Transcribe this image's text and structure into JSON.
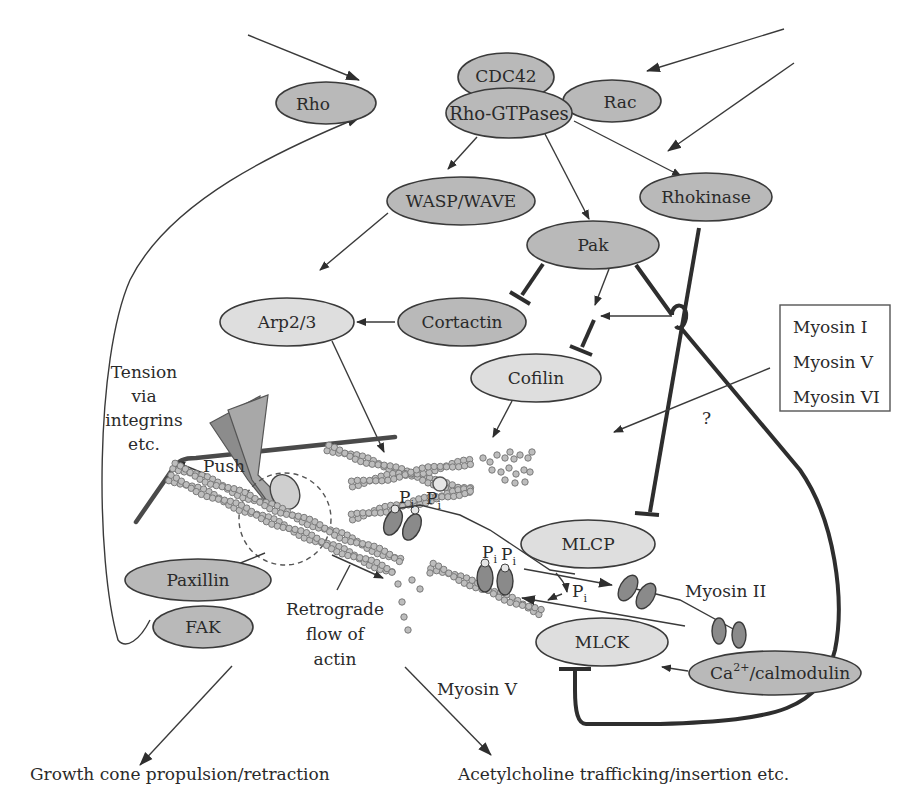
{
  "diagram": {
    "colors": {
      "background": "#ffffff",
      "node_dark_fill": "#b9b9b9",
      "node_light_fill": "#dedede",
      "stroke": "#3a3a3a",
      "actin_bead": "#bdbdbd"
    },
    "nodes": {
      "cdc42": "CDC42",
      "rho": "Rho",
      "rho_gtpases": "Rho-GTPases",
      "rac": "Rac",
      "wasp_wave": "WASP/WAVE",
      "pak": "Pak",
      "rhokinase": "Rhokinase",
      "arp23": "Arp2/3",
      "cortactin": "Cortactin",
      "cofilin": "Cofilin",
      "mlcp": "MLCP",
      "mlck": "MLCK",
      "calmodulin_base": "Ca",
      "calmodulin_sup": "2+",
      "calmodulin_rest": "/calmodulin",
      "paxillin": "Paxillin",
      "fak": "FAK"
    },
    "myosin_box": {
      "items": [
        "Myosin I",
        "Myosin V",
        "Myosin VI"
      ]
    },
    "labels": {
      "tension": [
        "Tension",
        "via",
        "integrins",
        "etc."
      ],
      "push": "Push",
      "retrograde": [
        "Retrograde",
        "flow of",
        "actin"
      ],
      "question": "?",
      "myosin_ii": "Myosin II",
      "myosin_v": "Myosin V",
      "pi_base": "P",
      "pi_sub": "i"
    },
    "outcomes": {
      "growth_cone": "Growth cone propulsion/retraction",
      "acetylcholine": "Acetylcholine trafficking/insertion etc."
    },
    "edge_types": {
      "activation": "arrow",
      "inhibition": "T-bar"
    }
  }
}
